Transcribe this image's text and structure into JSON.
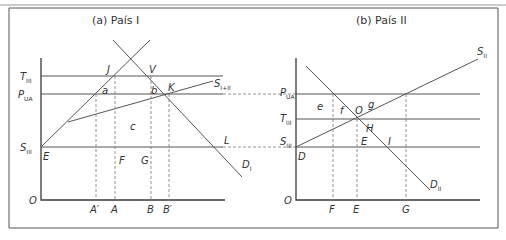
{
  "figure": {
    "top_caption_fragment": "",
    "panels": [
      {
        "id": "a",
        "title": "(a) País I",
        "origin_label": "O",
        "y_labels": [
          {
            "main": "T",
            "sub": "III",
            "key": "T_III"
          },
          {
            "main": "P",
            "sub": "UA",
            "key": "P_UA"
          },
          {
            "main": "S",
            "sub": "III",
            "key": "S_III"
          }
        ],
        "x_labels": [
          "A′",
          "A",
          "B",
          "B′"
        ],
        "point_labels": [
          "J",
          "V",
          "a",
          "b",
          "K",
          "c",
          "E",
          "F",
          "G",
          "L"
        ],
        "curve_labels": [
          {
            "main": "S",
            "sub": "I+II",
            "key": "S_I+II"
          },
          {
            "main": "D",
            "sub": "I",
            "key": "D_I"
          }
        ]
      },
      {
        "id": "b",
        "title": "(b) País II",
        "origin_label": "O",
        "y_labels": [
          {
            "main": "P",
            "sub": "UA",
            "key": "P_UA"
          },
          {
            "main": "T",
            "sub": "III",
            "key": "T_III"
          },
          {
            "main": "S",
            "sub": "III",
            "key": "S_III"
          }
        ],
        "x_labels": [
          "F",
          "E",
          "G"
        ],
        "point_labels": [
          "e",
          "f",
          "O",
          "g",
          "H",
          "E",
          "I",
          "D"
        ],
        "curve_labels": [
          {
            "main": "S",
            "sub": "II",
            "key": "S_II"
          },
          {
            "main": "D",
            "sub": "II",
            "key": "D_II"
          }
        ]
      }
    ]
  },
  "labels": {
    "a_title": "(a) País I",
    "b_title": "(b) País II",
    "a_O": "O",
    "a_T": "T",
    "a_T_sub": "III",
    "a_P": "P",
    "a_P_sub": "UA",
    "a_S": "S",
    "a_S_sub": "III",
    "a_Aprime": "A′",
    "a_A": "A",
    "a_B": "B",
    "a_Bprime": "B′",
    "a_J": "J",
    "a_V": "V",
    "a_a": "a",
    "a_b": "b",
    "a_K": "K",
    "a_c": "c",
    "a_E": "E",
    "a_F": "F",
    "a_G": "G",
    "a_L": "L",
    "a_SI": "S",
    "a_SI_sub": "I+II",
    "a_DI": "D",
    "a_DI_sub": "I",
    "b_O_axis": "O",
    "b_P": "P",
    "b_P_sub": "UA",
    "b_T": "T",
    "b_T_sub": "III",
    "b_S": "S",
    "b_S_sub": "III",
    "b_F": "F",
    "b_E": "E",
    "b_G": "G",
    "b_e": "e",
    "b_f": "f",
    "b_O": "O",
    "b_g": "g",
    "b_H": "H",
    "b_Ept": "E",
    "b_I": "I",
    "b_D": "D",
    "b_SII": "S",
    "b_SII_sub": "II",
    "b_DII": "D",
    "b_DII_sub": "II"
  }
}
